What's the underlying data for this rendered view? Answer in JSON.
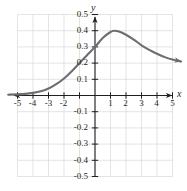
{
  "chart_data": {
    "type": "line",
    "title": "",
    "subtitle": "",
    "xlabel": "x",
    "ylabel": "y",
    "xlim": [
      -5.8,
      5.8
    ],
    "ylim": [
      -0.58,
      0.58
    ],
    "grid": true,
    "grid_color": "#d9d9d9",
    "axis_color": "#231f20",
    "curve_color": "#6d6e71",
    "legend": null,
    "legend_position": "none",
    "x_ticks": [
      -5,
      -4,
      -3,
      -2,
      -1,
      1,
      2,
      3,
      4,
      5
    ],
    "x_tick_labels": [
      "-5",
      "-4",
      "-3",
      "-2",
      "",
      "1",
      "2",
      "3",
      "4",
      "5"
    ],
    "y_ticks": [
      -0.5,
      -0.4,
      -0.3,
      -0.2,
      -0.1,
      0.1,
      0.2,
      0.3,
      0.4,
      0.5
    ],
    "y_tick_labels": [
      "-0.5",
      "-0.4",
      "-0.3",
      "-0.2",
      "-0.1",
      "0.1",
      "0.2",
      "0.3",
      "0.4",
      "0.5"
    ],
    "x_axis_arrows": [
      "left",
      "right"
    ],
    "y_axis_arrows": [
      "up"
    ],
    "series": [
      {
        "name": "curve",
        "start_arrow": false,
        "end_arrow": true,
        "points": [
          [
            -5.6,
            0.005
          ],
          [
            -5.0,
            0.007
          ],
          [
            -4.5,
            0.01
          ],
          [
            -4.0,
            0.016
          ],
          [
            -3.5,
            0.026
          ],
          [
            -3.0,
            0.043
          ],
          [
            -2.5,
            0.07
          ],
          [
            -2.0,
            0.105
          ],
          [
            -1.5,
            0.15
          ],
          [
            -1.0,
            0.2
          ],
          [
            -0.5,
            0.25
          ],
          [
            0.0,
            0.3
          ],
          [
            0.5,
            0.355
          ],
          [
            1.0,
            0.392
          ],
          [
            1.25,
            0.4
          ],
          [
            1.5,
            0.396
          ],
          [
            2.0,
            0.375
          ],
          [
            2.5,
            0.345
          ],
          [
            3.0,
            0.31
          ],
          [
            3.5,
            0.282
          ],
          [
            4.0,
            0.258
          ],
          [
            4.5,
            0.237
          ],
          [
            5.0,
            0.222
          ],
          [
            5.55,
            0.21
          ]
        ]
      }
    ],
    "peak": {
      "x": 1.25,
      "y": 0.4
    }
  }
}
